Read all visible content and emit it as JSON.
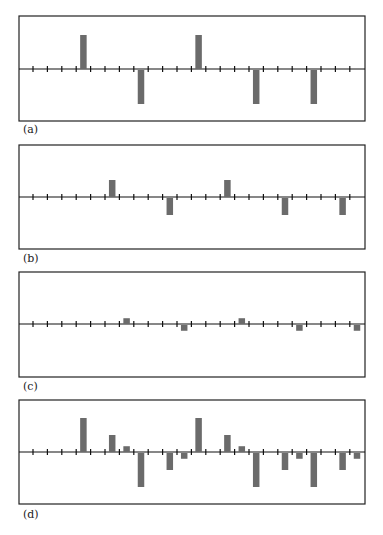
{
  "figure": {
    "width": 383,
    "height": 535,
    "bar_color": "#6b6b6b",
    "line_color": "#111111"
  },
  "chart_data": [
    {
      "type": "bar",
      "label": "(a)",
      "title": "",
      "xlabel": "",
      "ylabel": "",
      "grid": false,
      "tick_count": 23,
      "ylim": [
        -1.2,
        1.2
      ],
      "bars": [
        {
          "position": 3.5,
          "value": 1.0
        },
        {
          "position": 7.5,
          "value": -1.0
        },
        {
          "position": 11.5,
          "value": 1.0
        },
        {
          "position": 15.5,
          "value": -1.0
        },
        {
          "position": 19.5,
          "value": -1.0
        }
      ]
    },
    {
      "type": "bar",
      "label": "(b)",
      "title": "",
      "xlabel": "",
      "ylabel": "",
      "grid": false,
      "tick_count": 23,
      "ylim": [
        -1.2,
        1.2
      ],
      "bars": [
        {
          "position": 5.5,
          "value": 0.5
        },
        {
          "position": 9.5,
          "value": -0.5
        },
        {
          "position": 13.5,
          "value": 0.5
        },
        {
          "position": 17.5,
          "value": -0.5
        },
        {
          "position": 21.5,
          "value": -0.5
        }
      ]
    },
    {
      "type": "bar",
      "label": "(c)",
      "title": "",
      "xlabel": "",
      "ylabel": "",
      "grid": false,
      "tick_count": 23,
      "ylim": [
        -1.2,
        1.2
      ],
      "bars": [
        {
          "position": 6.5,
          "value": 0.17
        },
        {
          "position": 10.5,
          "value": -0.17
        },
        {
          "position": 14.5,
          "value": 0.17
        },
        {
          "position": 18.5,
          "value": -0.17
        },
        {
          "position": 22.5,
          "value": -0.17
        }
      ]
    },
    {
      "type": "bar",
      "label": "(d)",
      "title": "",
      "xlabel": "",
      "ylabel": "",
      "grid": false,
      "tick_count": 23,
      "ylim": [
        -1.2,
        1.2
      ],
      "bars": [
        {
          "position": 3.5,
          "value": 1.0
        },
        {
          "position": 5.5,
          "value": 0.5
        },
        {
          "position": 6.5,
          "value": 0.17
        },
        {
          "position": 7.5,
          "value": -1.0
        },
        {
          "position": 9.5,
          "value": -0.5
        },
        {
          "position": 10.5,
          "value": -0.17
        },
        {
          "position": 11.5,
          "value": 1.0
        },
        {
          "position": 13.5,
          "value": 0.5
        },
        {
          "position": 14.5,
          "value": 0.17
        },
        {
          "position": 15.5,
          "value": -1.0
        },
        {
          "position": 17.5,
          "value": -0.5
        },
        {
          "position": 18.5,
          "value": -0.17
        },
        {
          "position": 19.5,
          "value": -1.0
        },
        {
          "position": 21.5,
          "value": -0.5
        },
        {
          "position": 22.5,
          "value": -0.17
        }
      ]
    }
  ],
  "panels_layout": [
    {
      "top": 16,
      "bottom": 121,
      "axis_y": 69,
      "label_y": 133
    },
    {
      "top": 145,
      "bottom": 249,
      "axis_y": 197,
      "label_y": 262
    },
    {
      "top": 272,
      "bottom": 377,
      "axis_y": 324,
      "label_y": 390
    },
    {
      "top": 400,
      "bottom": 504,
      "axis_y": 452,
      "label_y": 518
    }
  ]
}
